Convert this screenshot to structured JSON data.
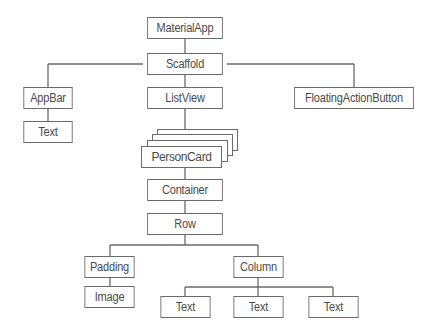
{
  "diagram": {
    "type": "widget-tree",
    "nodes": {
      "material_app": "MaterialApp",
      "scaffold": "Scaffold",
      "app_bar": "AppBar",
      "app_bar_text": "Text",
      "list_view": "ListView",
      "floating_action_button": "FloatingActionButton",
      "person_card": "PersonCard",
      "container": "Container",
      "row": "Row",
      "padding": "Padding",
      "image": "Image",
      "column": "Column",
      "column_text_1": "Text",
      "column_text_2": "Text",
      "column_text_3": "Text"
    },
    "edges": [
      [
        "MaterialApp",
        "Scaffold"
      ],
      [
        "Scaffold",
        "AppBar"
      ],
      [
        "Scaffold",
        "ListView"
      ],
      [
        "Scaffold",
        "FloatingActionButton"
      ],
      [
        "AppBar",
        "Text"
      ],
      [
        "ListView",
        "PersonCard"
      ],
      [
        "PersonCard",
        "Container"
      ],
      [
        "Container",
        "Row"
      ],
      [
        "Row",
        "Padding"
      ],
      [
        "Row",
        "Column"
      ],
      [
        "Padding",
        "Image"
      ],
      [
        "Column",
        "Text"
      ],
      [
        "Column",
        "Text"
      ],
      [
        "Column",
        "Text"
      ]
    ],
    "person_card_stacked_copies": 4
  }
}
